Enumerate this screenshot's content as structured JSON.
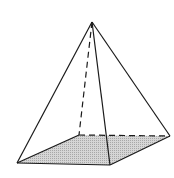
{
  "diagram": {
    "type": "square-pyramid",
    "colors": {
      "stroke": "#1a1a1a",
      "base_fill": "#c8c8c8",
      "background": "#ffffff"
    },
    "vertices": {
      "apex": [
        92,
        22
      ],
      "base_front_left": [
        17,
        163
      ],
      "base_front_right": [
        110,
        165
      ],
      "base_back_right": [
        170,
        136
      ],
      "base_back_left": [
        79,
        135
      ]
    },
    "edges_visible": [
      "apex-front_left",
      "apex-front_right",
      "apex-back_right",
      "front_left-front_right",
      "front_right-back_right",
      "front_left-back_left"
    ],
    "edges_hidden": [
      "apex-back_left",
      "back_left-back_right"
    ]
  }
}
